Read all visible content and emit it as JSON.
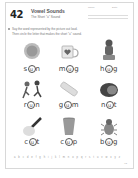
{
  "header": {
    "lesson_number": "42",
    "title": "Vowel Sounds",
    "subtitle": "The Short \"u\" Sound",
    "fields": [
      "Name",
      "Date"
    ]
  },
  "instructions": {
    "line1": "Say the word represented by the picture out loud.",
    "line2": "Then circle the letter that makes the short \"u\" sound."
  },
  "items": [
    {
      "picture": "sun-icon",
      "before": "s",
      "vowel": "u",
      "after": "n"
    },
    {
      "picture": "mug-icon",
      "before": "m",
      "vowel": "u",
      "after": "g"
    },
    {
      "picture": "hug-icon",
      "before": "h",
      "vowel": "u",
      "after": "g"
    },
    {
      "picture": "run-icon",
      "before": "r",
      "vowel": "u",
      "after": "n"
    },
    {
      "picture": "gum-icon",
      "before": "g",
      "vowel": "u",
      "after": "m"
    },
    {
      "picture": "nut-icon",
      "before": "n",
      "vowel": "u",
      "after": "t"
    },
    {
      "picture": "cut-icon",
      "before": "c",
      "vowel": "u",
      "after": "t"
    },
    {
      "picture": "cup-icon",
      "before": "c",
      "vowel": "u",
      "after": "p"
    },
    {
      "picture": "bug-icon",
      "before": "b",
      "vowel": "u",
      "after": "g"
    }
  ],
  "alphabet": "a b c d e f g h i j k l m n o p q r s t u v w x y z",
  "page_number": "43"
}
